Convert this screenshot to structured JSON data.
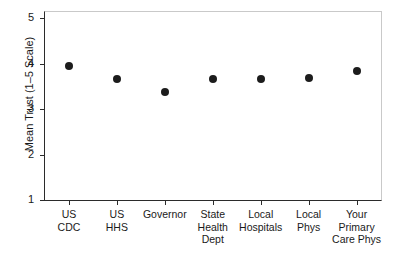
{
  "chart_data": {
    "type": "scatter",
    "title": "",
    "xlabel": "",
    "ylabel": "Mean Trust (1–5 Scale)",
    "ylim": [
      1,
      5
    ],
    "yticks": [
      1,
      2,
      3,
      4,
      5
    ],
    "ytick_labels": [
      "1",
      "2",
      "3",
      "4",
      "5"
    ],
    "grid": false,
    "legend": false,
    "point_color": "#1c1c1c",
    "axis_color": "#2b2b2b",
    "categories": [
      "US CDC",
      "US HHS",
      "Governor",
      "State Health Dept",
      "Local Hospitals",
      "Local Phys",
      "Your Primary Care Phys"
    ],
    "category_lines": [
      [
        "US",
        "CDC"
      ],
      [
        "US",
        "HHS"
      ],
      [
        "Governor"
      ],
      [
        "State",
        "Health",
        "Dept"
      ],
      [
        "Local",
        "Hospitals"
      ],
      [
        "Local",
        "Phys"
      ],
      [
        "Your",
        "Primary",
        "Care Phys"
      ]
    ],
    "values": [
      3.95,
      3.67,
      3.38,
      3.67,
      3.67,
      3.68,
      3.84
    ]
  }
}
